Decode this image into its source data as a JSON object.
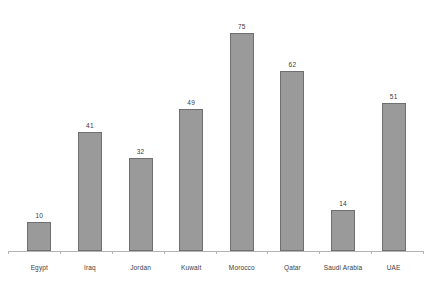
{
  "chart_data": {
    "type": "bar",
    "title": "",
    "subtitle": "",
    "xlabel": "",
    "ylabel": "",
    "categories": [
      "Egypt",
      "Iraq",
      "Jordan",
      "Kuwait",
      "Morocco",
      "Qatar",
      "Saudi Arabia",
      "UAE"
    ],
    "values": [
      10,
      41,
      32,
      49,
      75,
      62,
      14,
      51
    ],
    "value_labels": [
      "10",
      "41",
      "32",
      "49",
      "75",
      "62",
      "14",
      "51"
    ],
    "ylim": [
      0,
      80
    ],
    "grid": false,
    "legend": null,
    "legend_position": "none",
    "axis": {
      "x_axis_visible": true,
      "y_axis_visible": false,
      "tick_marks": true,
      "tick_count": 9
    },
    "style": {
      "bar_fill": "#9a9a9a",
      "bar_border": "#6f6f6f",
      "axis_color": "#b3b3b3",
      "label_color": "#3c3c3c",
      "value_color": "#3a3a3a",
      "background": "#ffffff"
    }
  },
  "caption": {
    "text": ""
  }
}
